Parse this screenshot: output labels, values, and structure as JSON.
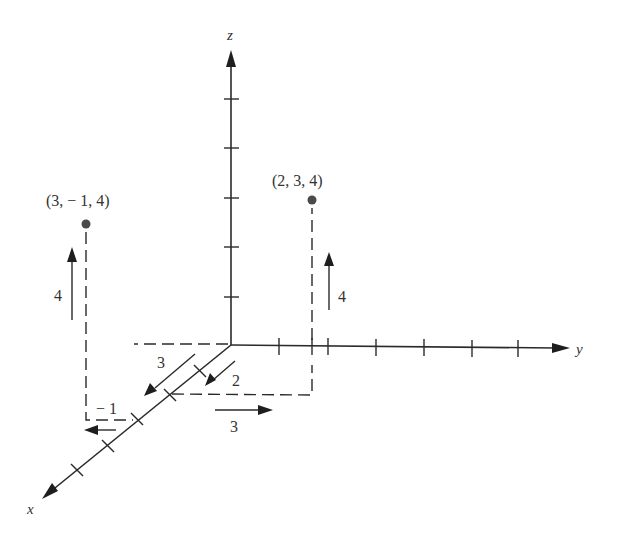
{
  "diagram": {
    "axes": {
      "x_label": "x",
      "y_label": "y",
      "z_label": "z"
    },
    "points": [
      {
        "label": "(2, 3, 4)",
        "x": 2,
        "y": 3,
        "z": 4
      },
      {
        "label": "(3, − 1, 4)",
        "x": 3,
        "y": -1,
        "z": 4
      }
    ],
    "step_labels": {
      "p1_x_step": "2",
      "p1_y_step": "3",
      "p1_z_step": "4",
      "p2_x_step": "3",
      "p2_y_step": "− 1",
      "p2_z_step": "4"
    },
    "colors": {
      "ink": "#2a2a2a",
      "point": "#4a4a4a",
      "background": "#ffffff"
    }
  }
}
